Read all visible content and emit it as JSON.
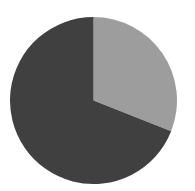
{
  "chart_data": {
    "type": "pie",
    "title": "",
    "categories": [
      "Slice A",
      "Slice B"
    ],
    "values": [
      31,
      69
    ],
    "colors": [
      "#9d9d9d",
      "#404040"
    ],
    "start_angle_deg": 0,
    "direction": "clockwise",
    "legend": null,
    "labels_shown": false
  },
  "layout": {
    "cx": 93.5,
    "cy": 100.5,
    "r": 83.5
  }
}
